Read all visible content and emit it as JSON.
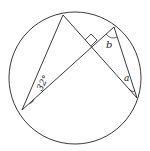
{
  "diagram": {
    "type": "circle-geometry",
    "circle": {
      "cx": 75,
      "cy": 78,
      "r": 66
    },
    "points": {
      "A": [
        63,
        15
      ],
      "B": [
        114,
        27
      ],
      "C": [
        22,
        110
      ],
      "D": [
        137,
        98
      ]
    },
    "segments": [
      [
        "C",
        "A"
      ],
      [
        "A",
        "D"
      ],
      [
        "C",
        "B"
      ],
      [
        "B",
        "D"
      ]
    ],
    "labels": {
      "angle_given": "32°",
      "angle_b": "b",
      "angle_a": "a"
    },
    "right_angle_marker": true,
    "stroke_color": "#222222"
  }
}
